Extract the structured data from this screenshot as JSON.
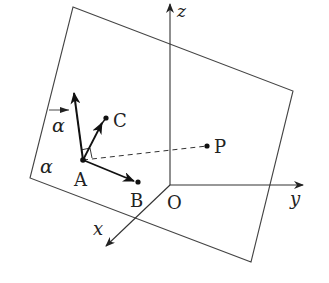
{
  "diagram": {
    "type": "3d-coordinate-geometry",
    "colors": {
      "stroke": "#222222",
      "plane": "#444444",
      "background": "#ffffff"
    },
    "axes": {
      "z_label": "z",
      "y_label": "y",
      "x_label": "x",
      "origin_label": "O"
    },
    "plane": {
      "label": "α",
      "normal_vector_label": "α",
      "normal_vector_arrow": "→"
    },
    "points": {
      "A": "A",
      "B": "B",
      "C": "C",
      "P": "P"
    },
    "segments": [
      {
        "from": "A",
        "to": "B",
        "style": "arrow"
      },
      {
        "from": "A",
        "to": "C",
        "style": "arrow"
      },
      {
        "from": "A",
        "to": "normal",
        "style": "arrow"
      },
      {
        "from": "A",
        "to": "P",
        "style": "dashed"
      }
    ]
  }
}
